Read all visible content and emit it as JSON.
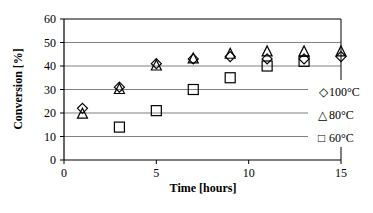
{
  "chart_data": {
    "type": "scatter",
    "title": "",
    "xlabel": "Time [hours]",
    "ylabel": "Conversion [%]",
    "xlim": [
      0,
      15
    ],
    "ylim": [
      0,
      60
    ],
    "x_ticks": [
      0,
      5,
      10,
      15
    ],
    "y_ticks": [
      0,
      10,
      20,
      30,
      40,
      50,
      60
    ],
    "grid": "horizontal",
    "legend_position": "right",
    "series": [
      {
        "name": "100°C",
        "marker": "diamond",
        "x": [
          1,
          3,
          5,
          7,
          9,
          11,
          13,
          15
        ],
        "values": [
          22,
          31,
          41,
          43,
          44,
          43,
          43,
          44
        ]
      },
      {
        "name": "80°C",
        "marker": "triangle",
        "x": [
          1,
          3,
          5,
          7,
          9,
          11,
          13,
          15
        ],
        "values": [
          19.5,
          30,
          40,
          43,
          45,
          46,
          46,
          46
        ]
      },
      {
        "name": "60°C",
        "marker": "square",
        "x": [
          3,
          5,
          7,
          9,
          11,
          13
        ],
        "values": [
          14,
          21,
          30,
          35,
          40,
          42
        ]
      }
    ]
  },
  "legend": {
    "items": [
      {
        "symbol": "◇",
        "label": "100°C"
      },
      {
        "symbol": "△",
        "label": "80°C"
      },
      {
        "symbol": "□",
        "label": "60°C"
      }
    ]
  },
  "colors": {
    "axis": "#000000",
    "grid": "#808080",
    "marker_stroke": "#000000",
    "background": "#ffffff"
  }
}
